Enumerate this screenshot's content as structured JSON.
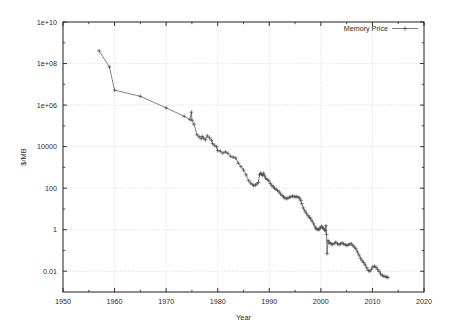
{
  "chart_data": {
    "type": "line",
    "title": "",
    "xlabel": "Year",
    "ylabel": "$/MB",
    "xlim": [
      1950,
      2020
    ],
    "ylim": [
      0.001,
      10000000000
    ],
    "yscale": "log",
    "xscale": "linear",
    "grid": true,
    "legend_position": "top-right",
    "xticks": [
      1950,
      1960,
      1970,
      1980,
      1990,
      2000,
      2010,
      2020
    ],
    "xtick_labels": [
      "1950",
      "1960",
      "1970",
      "1980",
      "1990",
      "2000",
      "2010",
      "2020"
    ],
    "xminor_ticks": [
      1955,
      1965,
      1975,
      1985,
      1995,
      2005,
      2015
    ],
    "yticks": [
      0.01,
      1,
      100,
      10000,
      1000000,
      100000000,
      10000000000
    ],
    "ytick_labels": [
      "0.01",
      "1",
      "100",
      "10000",
      "1e+06",
      "1e+08",
      "1e+10"
    ],
    "yminor_ticks": [
      0.1,
      10,
      1000,
      100000,
      10000000,
      1000000000
    ],
    "marker": "plus",
    "line_color": "#4a4a4a",
    "grid_color": "#c8c8c8",
    "frame_color": "#1e1e1e",
    "series": [
      {
        "name": "Memory Price",
        "points": [
          [
            1957.0,
            411000000
          ],
          [
            1959.0,
            67900000
          ],
          [
            1960.0,
            5242880
          ],
          [
            1965.0,
            2642000
          ],
          [
            1970.0,
            734000
          ],
          [
            1973.5,
            289000
          ],
          [
            1974.6,
            200000
          ],
          [
            1974.9,
            455000
          ],
          [
            1975.0,
            186000
          ],
          [
            1975.4,
            120000
          ],
          [
            1976.0,
            37000
          ],
          [
            1976.4,
            29500
          ],
          [
            1976.8,
            24000
          ],
          [
            1977.0,
            31000
          ],
          [
            1977.3,
            26000
          ],
          [
            1977.6,
            21000
          ],
          [
            1978.0,
            33000
          ],
          [
            1978.4,
            26500
          ],
          [
            1978.8,
            20000
          ],
          [
            1979.0,
            14000
          ],
          [
            1979.4,
            11500
          ],
          [
            1979.8,
            9800
          ],
          [
            1980.0,
            6480
          ],
          [
            1980.5,
            6000
          ],
          [
            1981.0,
            4900
          ],
          [
            1981.5,
            5600
          ],
          [
            1982.0,
            4700
          ],
          [
            1982.5,
            3400
          ],
          [
            1983.0,
            3100
          ],
          [
            1983.5,
            2800
          ],
          [
            1984.0,
            1600
          ],
          [
            1984.5,
            1100
          ],
          [
            1985.0,
            750
          ],
          [
            1985.5,
            440
          ],
          [
            1986.0,
            230
          ],
          [
            1986.4,
            175
          ],
          [
            1986.8,
            148
          ],
          [
            1987.0,
            133
          ],
          [
            1987.3,
            140
          ],
          [
            1987.6,
            160
          ],
          [
            1987.9,
            190
          ],
          [
            1988.1,
            440
          ],
          [
            1988.3,
            520
          ],
          [
            1988.5,
            480
          ],
          [
            1988.7,
            410
          ],
          [
            1988.9,
            520
          ],
          [
            1989.1,
            390
          ],
          [
            1989.3,
            300
          ],
          [
            1989.6,
            260
          ],
          [
            1989.9,
            230
          ],
          [
            1990.2,
            170
          ],
          [
            1990.5,
            135
          ],
          [
            1990.8,
            115
          ],
          [
            1991.0,
            100
          ],
          [
            1991.3,
            88
          ],
          [
            1991.6,
            78
          ],
          [
            1991.9,
            66
          ],
          [
            1992.2,
            52
          ],
          [
            1992.5,
            44
          ],
          [
            1992.8,
            38
          ],
          [
            1993.0,
            34
          ],
          [
            1993.3,
            31
          ],
          [
            1993.6,
            33
          ],
          [
            1993.9,
            36
          ],
          [
            1994.2,
            39
          ],
          [
            1994.5,
            41
          ],
          [
            1994.8,
            40
          ],
          [
            1995.0,
            38
          ],
          [
            1995.3,
            39
          ],
          [
            1995.6,
            37
          ],
          [
            1995.9,
            33
          ],
          [
            1996.1,
            26
          ],
          [
            1996.3,
            18
          ],
          [
            1996.6,
            11
          ],
          [
            1996.9,
            8.0
          ],
          [
            1997.2,
            6.2
          ],
          [
            1997.5,
            4.7
          ],
          [
            1997.8,
            4.0
          ],
          [
            1998.0,
            3.4
          ],
          [
            1998.3,
            2.6
          ],
          [
            1998.6,
            1.9
          ],
          [
            1998.9,
            1.35
          ],
          [
            1999.1,
            1.1
          ],
          [
            1999.3,
            1.05
          ],
          [
            1999.5,
            1.0
          ],
          [
            1999.7,
            1.05
          ],
          [
            1999.9,
            1.25
          ],
          [
            2000.1,
            1.45
          ],
          [
            2000.3,
            1.3
          ],
          [
            2000.5,
            1.15
          ],
          [
            2000.7,
            1.0
          ],
          [
            2000.9,
            0.88
          ],
          [
            2001.0,
            1.55
          ],
          [
            2001.1,
            0.6
          ],
          [
            2001.2,
            0.07
          ],
          [
            2001.4,
            0.3
          ],
          [
            2001.6,
            0.24
          ],
          [
            2001.8,
            0.22
          ],
          [
            2002.0,
            0.21
          ],
          [
            2002.3,
            0.19
          ],
          [
            2002.6,
            0.22
          ],
          [
            2002.9,
            0.25
          ],
          [
            2003.2,
            0.21
          ],
          [
            2003.5,
            0.19
          ],
          [
            2003.8,
            0.21
          ],
          [
            2004.1,
            0.23
          ],
          [
            2004.4,
            0.21
          ],
          [
            2004.7,
            0.19
          ],
          [
            2005.0,
            0.175
          ],
          [
            2005.3,
            0.185
          ],
          [
            2005.6,
            0.2
          ],
          [
            2005.9,
            0.21
          ],
          [
            2006.2,
            0.175
          ],
          [
            2006.5,
            0.145
          ],
          [
            2006.8,
            0.12
          ],
          [
            2007.1,
            0.085
          ],
          [
            2007.4,
            0.06
          ],
          [
            2007.7,
            0.042
          ],
          [
            2008.0,
            0.032
          ],
          [
            2008.3,
            0.026
          ],
          [
            2008.6,
            0.02
          ],
          [
            2008.9,
            0.0145
          ],
          [
            2009.2,
            0.0108
          ],
          [
            2009.5,
            0.01
          ],
          [
            2009.8,
            0.0125
          ],
          [
            2010.1,
            0.016
          ],
          [
            2010.4,
            0.0175
          ],
          [
            2010.7,
            0.0155
          ],
          [
            2011.0,
            0.0125
          ],
          [
            2011.3,
            0.0098
          ],
          [
            2011.6,
            0.0075
          ],
          [
            2011.9,
            0.0062
          ],
          [
            2012.2,
            0.0058
          ],
          [
            2012.5,
            0.0055
          ],
          [
            2012.8,
            0.0052
          ],
          [
            2013.0,
            0.005
          ]
        ]
      }
    ]
  },
  "legend": {
    "entries": [
      {
        "label": "Memory Price",
        "marker": "plus"
      }
    ]
  },
  "axes": {
    "x_title": "Year",
    "y_title": "$/MB"
  }
}
